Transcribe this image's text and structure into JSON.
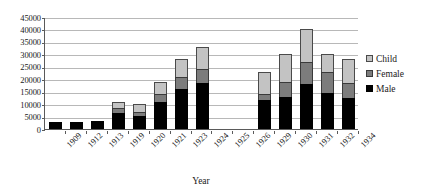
{
  "chart_data": {
    "type": "bar",
    "stacked": true,
    "title": "",
    "xlabel": "Year",
    "ylabel": "",
    "ylim": [
      0,
      45000
    ],
    "ytick_step": 5000,
    "yticks": [
      0,
      5000,
      10000,
      15000,
      20000,
      25000,
      30000,
      35000,
      40000,
      45000
    ],
    "ytick_labels": [
      "0",
      "5000",
      "10000",
      "15000",
      "20000",
      "25000",
      "30000",
      "35000",
      "40000",
      "45000"
    ],
    "grid": true,
    "grid_axis": "y",
    "legend_position": "right",
    "categories": [
      "1909",
      "1912",
      "1913",
      "1919",
      "1920",
      "1921",
      "1923",
      "1924",
      "1925",
      "1926",
      "1929",
      "1930",
      "1931",
      "1932",
      "1934"
    ],
    "series": [
      {
        "name": "Male",
        "color": "#000000",
        "values": [
          3000,
          3000,
          3300,
          6500,
          5200,
          11000,
          16000,
          18500,
          0,
          0,
          11500,
          13000,
          18000,
          14500,
          12500
        ]
      },
      {
        "name": "Female",
        "color": "#7c7c7c",
        "values": [
          0,
          0,
          0,
          1800,
          1800,
          3000,
          5000,
          5500,
          0,
          0,
          2500,
          6000,
          9000,
          8500,
          6000
        ]
      },
      {
        "name": "Child",
        "color": "#c3c3c3",
        "values": [
          0,
          0,
          0,
          2700,
          3200,
          5000,
          7000,
          9000,
          0,
          0,
          9000,
          11000,
          13000,
          7000,
          9500
        ]
      }
    ],
    "totals": [
      3000,
      3000,
      3300,
      11000,
      10200,
      19000,
      28000,
      33000,
      0,
      0,
      23000,
      30000,
      40000,
      30000,
      28000
    ],
    "stack_order_bottom_to_top": [
      "Male",
      "Female",
      "Child"
    ]
  },
  "legend": {
    "entries": [
      {
        "label": "Child",
        "swatch": "child"
      },
      {
        "label": "Female",
        "swatch": "female"
      },
      {
        "label": "Male",
        "swatch": "male"
      }
    ]
  },
  "axis": {
    "x_title": "Year"
  }
}
